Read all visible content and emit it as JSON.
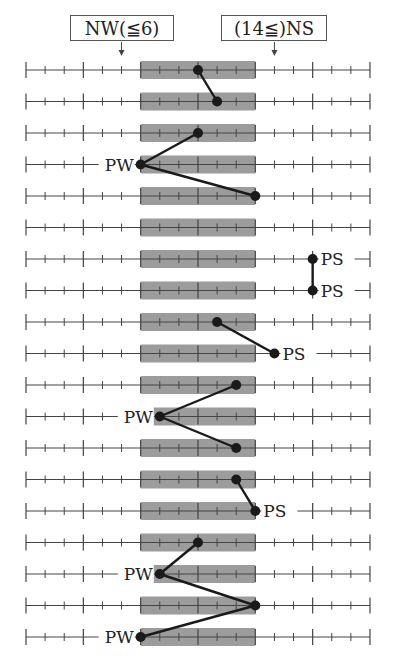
{
  "header": {
    "left_label": "NW(≦6)",
    "right_label": "(14≦)NS",
    "left_arrow_value": 5,
    "right_arrow_value": 13
  },
  "scale": {
    "min": 0,
    "max": 18,
    "major_every": 3,
    "shaded_range": [
      6,
      12
    ],
    "x0": 26,
    "unit_px": 19.11,
    "first_row_y": 70,
    "row_spacing": 31.5
  },
  "colors": {
    "line": "#444444",
    "shade": "#9c9c9c",
    "dot": "#1a1a1a",
    "text": "#222222"
  },
  "rows": [
    {
      "value": 9,
      "label": ""
    },
    {
      "value": 10,
      "label": ""
    },
    {
      "value": 9,
      "label": ""
    },
    {
      "value": 6,
      "label": "PW"
    },
    {
      "value": 12,
      "label": ""
    },
    {
      "value": null,
      "label": ""
    },
    {
      "value": 15,
      "label": "PS"
    },
    {
      "value": 15,
      "label": "PS"
    },
    {
      "value": 10,
      "label": ""
    },
    {
      "value": 13,
      "label": "PS"
    },
    {
      "value": 11,
      "label": ""
    },
    {
      "value": 7,
      "label": "PW"
    },
    {
      "value": 11,
      "label": ""
    },
    {
      "value": 11,
      "label": ""
    },
    {
      "value": 12,
      "label": "PS"
    },
    {
      "value": 9,
      "label": ""
    },
    {
      "value": 7,
      "label": "PW"
    },
    {
      "value": 12,
      "label": ""
    },
    {
      "value": 6,
      "label": "PW"
    }
  ],
  "connections": [
    [
      0,
      1
    ],
    [
      2,
      3
    ],
    [
      3,
      4
    ],
    [
      6,
      7
    ],
    [
      8,
      9
    ],
    [
      10,
      11
    ],
    [
      11,
      12
    ],
    [
      13,
      14
    ],
    [
      15,
      16
    ],
    [
      16,
      17
    ],
    [
      17,
      18
    ]
  ]
}
